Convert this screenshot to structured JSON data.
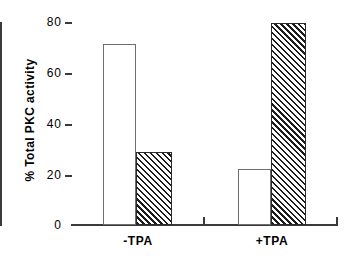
{
  "chart_data": {
    "type": "bar",
    "title": "",
    "xlabel": "",
    "ylabel": "% Total PKC activity",
    "categories": [
      "-TPA",
      "+TPA"
    ],
    "series": [
      {
        "name": "open",
        "fill": "open-white",
        "values": [
          71.5,
          22.1
        ]
      },
      {
        "name": "hatched",
        "fill": "diagonal-hatch",
        "values": [
          28.8,
          79.8
        ]
      }
    ],
    "ylim": [
      0,
      80
    ],
    "yticks": [
      0,
      20,
      40,
      60,
      80
    ],
    "ytick_labels": [
      "0",
      "20",
      "40",
      "60",
      "80"
    ],
    "grid": false,
    "legend": "none",
    "axis_color": "#3a3a3a",
    "bar_edge_color": "#2b2b2b",
    "hatch_color": "#1c1c1c",
    "background": "#ffffff"
  },
  "axes": {
    "y_label": "% Total PKC activity",
    "tick_labels": {
      "t80": "80",
      "t60": "60",
      "t40": "40",
      "t20": "20",
      "t0": "0"
    }
  },
  "groups": [
    {
      "label": "-TPA"
    },
    {
      "label": "+TPA"
    }
  ]
}
